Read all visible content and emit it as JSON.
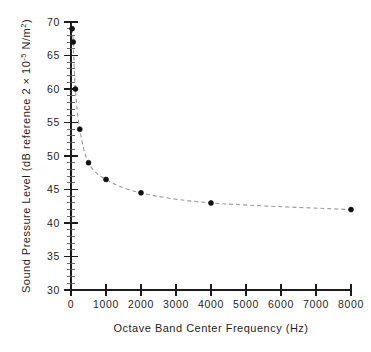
{
  "chart_data": {
    "type": "scatter",
    "title": "",
    "xlabel": "Octave Band Center Frequency (Hz)",
    "ylabel": "Sound Pressure Level (dB reference 2 × 10⁻⁵ N/m²)",
    "ylabel_parts": {
      "prefix": "Sound Pressure Level (dB reference 2 × 10",
      "exponent": "-5",
      "suffix": " N/m",
      "unit_exponent": "2",
      "close": ")"
    },
    "xlim": [
      0,
      8000
    ],
    "ylim": [
      30,
      70
    ],
    "xticks": [
      0,
      1000,
      2000,
      3000,
      4000,
      5000,
      6000,
      7000,
      8000
    ],
    "xtick_labels": [
      "0",
      "1000",
      "2000",
      "3000",
      "4000",
      "5000",
      "6000",
      "7000",
      "8000"
    ],
    "yticks": [
      30,
      35,
      40,
      45,
      50,
      55,
      60,
      65,
      70
    ],
    "ytick_labels": [
      "30",
      "35",
      "40",
      "45",
      "50",
      "55",
      "60",
      "65",
      "70"
    ],
    "y_minor_step": 1,
    "grid": false,
    "legend": false,
    "legend_position": "none",
    "marker": "filled-circle",
    "line_style": "dashed",
    "line_color": "#9a9a9a",
    "marker_color": "#111111",
    "axis_color": "#1c1c1c",
    "background_color": "#ffffff",
    "series": [
      {
        "name": "Octave band sound pressure level",
        "x": [
          31.5,
          63,
          125,
          250,
          500,
          1000,
          2000,
          4000,
          8000
        ],
        "y": [
          69.0,
          67.0,
          60.0,
          54.0,
          49.0,
          46.5,
          44.5,
          43.0,
          42.0
        ]
      }
    ]
  }
}
